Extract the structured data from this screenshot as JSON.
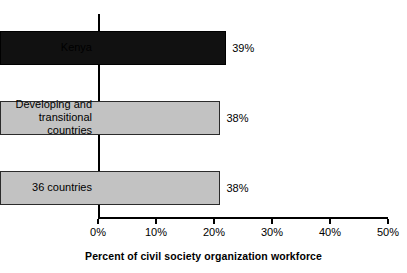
{
  "chart_data": {
    "type": "bar",
    "orientation": "horizontal",
    "title": "",
    "xlabel": "Percent of civil society organization workforce",
    "ylabel": "",
    "xlim": [
      0,
      50
    ],
    "xtick_labels": [
      "0%",
      "10%",
      "20%",
      "30%",
      "40%",
      "50%"
    ],
    "xtick_values": [
      0,
      10,
      20,
      30,
      40,
      50
    ],
    "grid": false,
    "legend": false,
    "categories": [
      "Kenya",
      "Developing and transitional countries",
      "36 countries"
    ],
    "values": [
      39,
      38,
      38
    ],
    "value_labels": [
      "39%",
      "38%",
      "38%"
    ],
    "colors": [
      "#111111",
      "#c2c2c2",
      "#c2c2c2"
    ],
    "border_color": "#2b2b2b",
    "bars": [
      {
        "category": "Kenya",
        "category_lines": "Kenya",
        "value": 39,
        "label": "39%",
        "color": "#111111",
        "style": "dark"
      },
      {
        "category": "Developing and transitional countries",
        "category_lines": "Developing and\ntransitional\ncountries",
        "value": 38,
        "label": "38%",
        "color": "#c2c2c2",
        "style": "light"
      },
      {
        "category": "36 countries",
        "category_lines": "36 countries",
        "value": 38,
        "label": "38%",
        "color": "#c2c2c2",
        "style": "light"
      }
    ]
  }
}
